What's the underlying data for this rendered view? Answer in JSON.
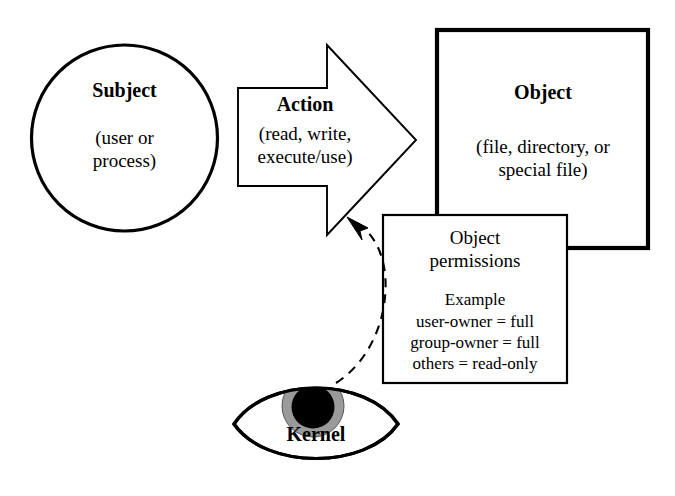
{
  "diagram": {
    "colors": {
      "stroke": "#000000",
      "background": "#ffffff",
      "iris_gray": "#9a9a9a",
      "pupil_black": "#000000"
    },
    "nodes": {
      "subject": {
        "title": "Subject",
        "line1": "(user or",
        "line2": "process)",
        "shape": "circle"
      },
      "action": {
        "title": "Action",
        "line1": "(read, write,",
        "line2": "execute/use)",
        "shape": "right-block-arrow"
      },
      "object": {
        "title": "Object",
        "line1": "(file, directory, or",
        "line2": "special file)",
        "shape": "rectangle-thick"
      },
      "permissions": {
        "title_line1": "Object",
        "title_line2": "permissions",
        "example_label": "Example",
        "rules": [
          "user-owner = full",
          "group-owner = full",
          "others = read-only"
        ],
        "shape": "rectangle"
      },
      "kernel": {
        "title": "Kernel",
        "shape": "eye"
      }
    },
    "connectors": {
      "kernel_to_action": {
        "style": "dashed-curve",
        "arrowhead": "at-action-arrow-tip",
        "from": "kernel",
        "to": "action"
      }
    }
  }
}
